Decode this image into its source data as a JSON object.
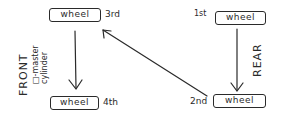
{
  "diagram": {
    "type": "brake-bleeding-order",
    "wheels": [
      {
        "id": "front-top",
        "label": "wheel",
        "order": "3rd"
      },
      {
        "id": "front-bottom",
        "label": "wheel",
        "order": "4th"
      },
      {
        "id": "rear-top",
        "label": "wheel",
        "order": "1st"
      },
      {
        "id": "rear-bottom",
        "label": "wheel",
        "order": "2nd"
      }
    ],
    "side_labels": {
      "front": "FRONT",
      "master_cylinder": "□-master cylinder",
      "rear": "REAR"
    },
    "arrows": [
      {
        "from": "rear-top",
        "to": "rear-bottom"
      },
      {
        "from": "rear-bottom",
        "to": "front-top"
      },
      {
        "from": "front-top",
        "to": "front-bottom"
      }
    ],
    "ink_color": "#2a2a2a"
  }
}
